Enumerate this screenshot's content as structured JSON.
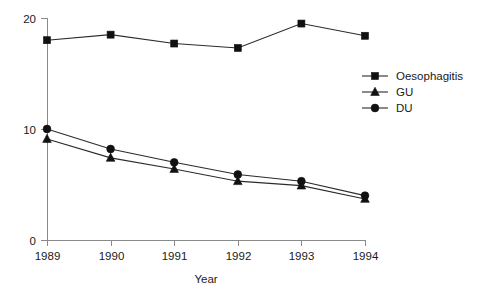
{
  "chart_data": {
    "type": "line",
    "title": "",
    "xlabel": "Year",
    "ylabel": "",
    "categories": [
      "1989",
      "1990",
      "1991",
      "1992",
      "1993",
      "1994"
    ],
    "x": [
      1989,
      1990,
      1991,
      1992,
      1993,
      1994
    ],
    "xlim": [
      1989,
      1994
    ],
    "ylim": [
      0,
      20
    ],
    "yticks": [
      "0",
      "10",
      "20"
    ],
    "ytick_values": [
      0,
      10,
      20
    ],
    "grid": false,
    "legend_position": "right",
    "series": [
      {
        "name": "Oesophagitis",
        "marker": "square",
        "color": "#111111",
        "values": [
          18.0,
          18.5,
          17.7,
          17.3,
          19.5,
          18.4
        ]
      },
      {
        "name": "GU",
        "marker": "triangle",
        "color": "#111111",
        "values": [
          9.1,
          7.4,
          6.4,
          5.3,
          4.9,
          3.7
        ]
      },
      {
        "name": "DU",
        "marker": "circle",
        "color": "#111111",
        "values": [
          10.0,
          8.2,
          7.0,
          5.9,
          5.3,
          4.0
        ]
      }
    ]
  },
  "axes": {
    "x_title": "Year",
    "y_title": ""
  },
  "legend": {
    "entries": [
      {
        "label": "Oesophagitis",
        "marker": "square-marker-icon"
      },
      {
        "label": "GU",
        "marker": "triangle-marker-icon"
      },
      {
        "label": "DU",
        "marker": "circle-marker-icon"
      }
    ]
  },
  "colors": {
    "ink": "#111111",
    "axis": "#8a8a8a",
    "line": "#2b2b2b",
    "background": "#ffffff"
  }
}
